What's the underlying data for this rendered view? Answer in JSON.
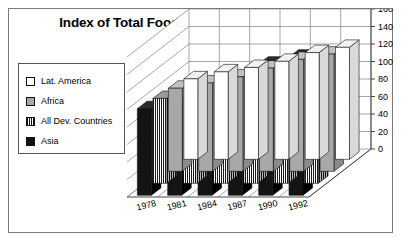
{
  "chart_data": {
    "type": "bar",
    "title": "Index of Total Food Production (1979-81=100)",
    "subtitle": "",
    "xlabel": "",
    "ylabel": "",
    "categories": [
      "1978",
      "1981",
      "1984",
      "1987",
      "1990",
      "1992"
    ],
    "series": [
      {
        "name": "Lat. America",
        "color": "#ffffff",
        "fill": "white",
        "values": [
          92,
          100,
          105,
          112,
          122,
          128
        ]
      },
      {
        "name": "Africa",
        "color": "#a8a8a8",
        "fill": "gray",
        "values": [
          95,
          101,
          108,
          118,
          128,
          134
        ]
      },
      {
        "name": "All Dev. Countries",
        "color": "#cccccc",
        "fill": "hatch",
        "values": [
          97,
          102,
          112,
          124,
          137,
          144
        ]
      },
      {
        "name": "Asia",
        "color": "#111111",
        "fill": "black",
        "values": [
          99,
          104,
          118,
          132,
          150,
          158
        ]
      }
    ],
    "ylim": [
      0,
      160
    ],
    "ytick_step": 20,
    "yticks": [
      "0",
      "20",
      "40",
      "60",
      "80",
      "100",
      "120",
      "140",
      "160"
    ],
    "grid": true,
    "legend_position": "left",
    "projection": "3d"
  },
  "legend": {
    "items": [
      {
        "label": "Lat. America",
        "swatch": "white-swatch"
      },
      {
        "label": "Africa",
        "swatch": "gray-swatch"
      },
      {
        "label": "All Dev. Countries",
        "swatch": "hatched-swatch"
      },
      {
        "label": "Asia",
        "swatch": "black-swatch"
      }
    ]
  }
}
